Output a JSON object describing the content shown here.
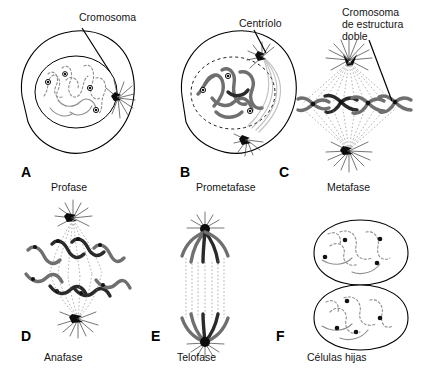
{
  "figure": {
    "title_implicit": "Mitosis",
    "language": "es",
    "background_color": "#ffffff",
    "ink_color": "#141414",
    "chromosome_color": "#6f6f6f",
    "chromosome_dark_color": "#2a2a2a",
    "spindle_color": "#7d7d7d"
  },
  "callouts": [
    {
      "id": "cromosoma",
      "text": "Cromosoma",
      "panel": "A"
    },
    {
      "id": "centriolo",
      "text": "Centríolo",
      "panel": "B"
    },
    {
      "id": "cromosoma_doble_l1",
      "text": "Cromosoma",
      "panel": "C"
    },
    {
      "id": "cromosoma_doble_l2",
      "text": "de estructura",
      "panel": "C"
    },
    {
      "id": "cromosoma_doble_l3",
      "text": "doble",
      "panel": "C"
    }
  ],
  "panels": [
    {
      "letter": "A",
      "phase": "Profase",
      "callout": "Cromosoma"
    },
    {
      "letter": "B",
      "phase": "Prometafase",
      "callout": "Centríolo"
    },
    {
      "letter": "C",
      "phase": "Metafase",
      "callout": "Cromosoma de estructura doble"
    },
    {
      "letter": "D",
      "phase": "Anafase",
      "callout": ""
    },
    {
      "letter": "E",
      "phase": "Telofase",
      "callout": ""
    },
    {
      "letter": "F",
      "phase": "Células hijas",
      "callout": ""
    }
  ]
}
